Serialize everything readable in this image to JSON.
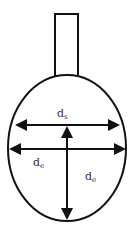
{
  "diagram": {
    "colors": {
      "stroke": "#111111",
      "background": "#ffffff",
      "label": "#333333"
    },
    "labels": {
      "top": {
        "main": "d",
        "sub": "s"
      },
      "left": {
        "main": "d",
        "sub": "e"
      },
      "right": {
        "main": "d",
        "sub": "e"
      }
    },
    "shapes": {
      "stem": "rectangle",
      "bulb": "ellipse",
      "arrows": [
        "horizontal-double-upper",
        "horizontal-double-middle",
        "vertical-double"
      ]
    }
  }
}
